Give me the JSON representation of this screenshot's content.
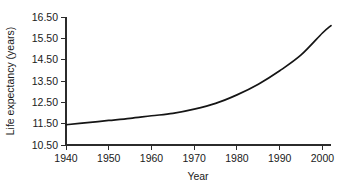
{
  "chart_data": {
    "type": "line",
    "title": "",
    "xlabel": "Year",
    "ylabel": "Life expectancy (years)",
    "xlim": [
      1940,
      2002
    ],
    "ylim": [
      10.5,
      16.5
    ],
    "grid": false,
    "legend": null,
    "xticks": [
      "1940",
      "1950",
      "1960",
      "1970",
      "1980",
      "1990",
      "2000"
    ],
    "xtick_values": [
      1940,
      1950,
      1960,
      1970,
      1980,
      1990,
      2000
    ],
    "yticks": [
      "10.50",
      "11.50",
      "12.50",
      "13.50",
      "14.50",
      "15.50",
      "16.50"
    ],
    "ytick_values": [
      10.5,
      11.5,
      12.5,
      13.5,
      14.5,
      15.5,
      16.5
    ],
    "series": [
      {
        "name": "Life expectancy",
        "color": "#151515",
        "x": [
          1940,
          1945,
          1950,
          1955,
          1960,
          1965,
          1970,
          1975,
          1980,
          1985,
          1990,
          1995,
          2000,
          2002
        ],
        "values": [
          11.45,
          11.55,
          11.65,
          11.75,
          11.87,
          11.98,
          12.18,
          12.45,
          12.85,
          13.35,
          13.98,
          14.72,
          15.75,
          16.1
        ]
      }
    ]
  },
  "axes": {
    "x_axis_name": "year-axis",
    "y_axis_name": "life-expectancy-axis"
  }
}
